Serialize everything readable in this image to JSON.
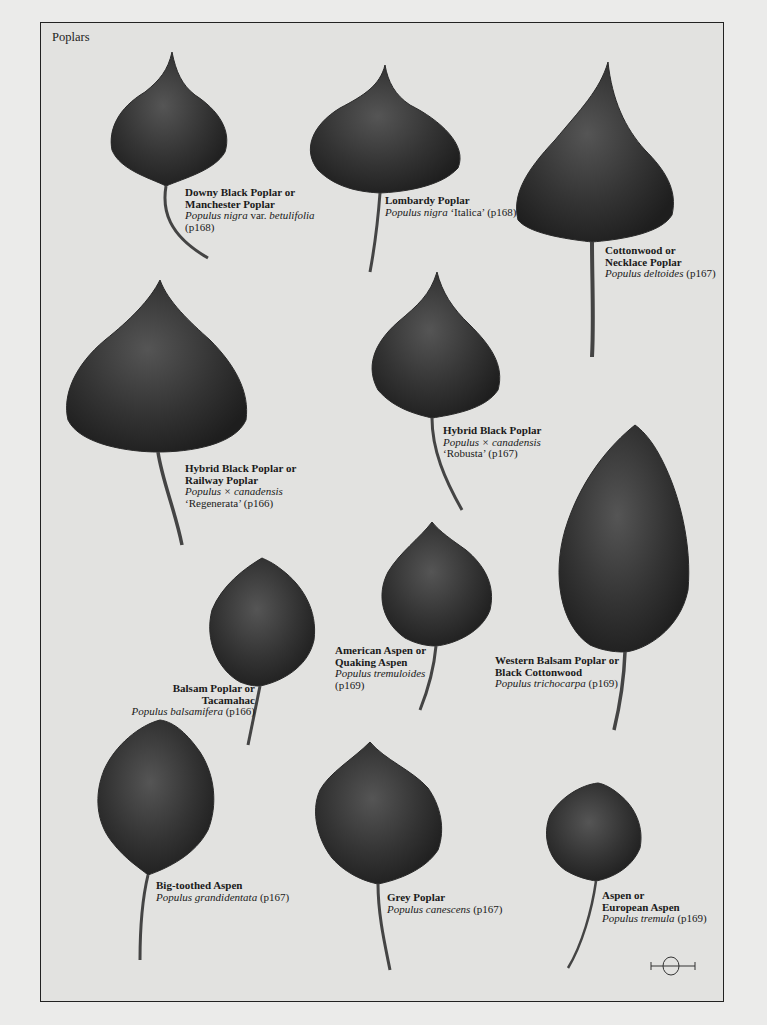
{
  "page": {
    "section_title": "Poplars"
  },
  "specimens": [
    {
      "common": [
        "Downy Black Poplar or",
        "Manchester Poplar"
      ],
      "latin": "Populus nigra",
      "latin_suffix": " var. ",
      "latin_2": "betulifolia",
      "page_ref": "(p168)"
    },
    {
      "common": [
        "Lombardy Poplar"
      ],
      "latin": "Populus nigra",
      "cultivar": " ‘Italica’ ",
      "page_ref": "(p168)"
    },
    {
      "common": [
        "Cottonwood or",
        "Necklace Poplar"
      ],
      "latin": "Populus deltoides",
      "page_ref": " (p167)"
    },
    {
      "common": [
        "Hybrid Black Poplar or",
        "Railway Poplar"
      ],
      "latin": "Populus × canadensis",
      "cultivar": "‘Regenerata’ ",
      "page_ref": "(p166)"
    },
    {
      "common": [
        "Hybrid Black Poplar"
      ],
      "latin": "Populus × canadensis",
      "cultivar": "‘Robusta’ ",
      "page_ref": "(p167)"
    },
    {
      "common": [
        "Balsam Poplar or",
        "Tacamahac"
      ],
      "latin": "Populus balsamifera",
      "page_ref": " (p166)"
    },
    {
      "common": [
        "American Aspen or",
        "Quaking Aspen"
      ],
      "latin": "Populus tremuloides",
      "page_ref": "(p169)"
    },
    {
      "common": [
        "Western Balsam Poplar or",
        "Black Cottonwood"
      ],
      "latin": "Populus trichocarpa",
      "page_ref": " (p169)"
    },
    {
      "common": [
        "Big-toothed Aspen"
      ],
      "latin": "Populus grandidentata",
      "page_ref": " (p167)"
    },
    {
      "common": [
        "Grey Poplar"
      ],
      "latin": "Populus canescens",
      "page_ref": " (p167)"
    },
    {
      "common": [
        "Aspen or",
        "European Aspen"
      ],
      "latin": "Populus tremula",
      "page_ref": " (p169)"
    }
  ],
  "colors": {
    "paper": "#e2e2e0",
    "leaf_dark": "#2a2a2a",
    "leaf_mid": "#4a4a4a",
    "text": "#1a1a1a"
  },
  "scale_icon": "scale-bar-icon"
}
